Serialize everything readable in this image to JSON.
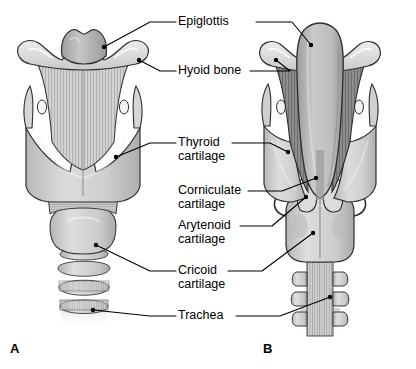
{
  "diagram": {
    "background": "#ffffff",
    "text_color": "#000000",
    "leader_color": "#000000"
  },
  "panels": [
    {
      "id": "A",
      "label": "A",
      "x": 10,
      "y": 341,
      "view": "anterior"
    },
    {
      "id": "B",
      "label": "B",
      "x": 263,
      "y": 341,
      "view": "posterior"
    }
  ],
  "labels": [
    {
      "name": "epiglottis",
      "line1": "Epiglottis",
      "line2": "",
      "x": 178,
      "y": 15
    },
    {
      "name": "hyoid-bone",
      "line1": "Hyoid bone",
      "line2": "",
      "x": 178,
      "y": 64
    },
    {
      "name": "thyroid",
      "line1": "Thyroid",
      "line2": "cartilage",
      "x": 178,
      "y": 136
    },
    {
      "name": "corniculate",
      "line1": "Corniculate",
      "line2": "cartilage",
      "x": 178,
      "y": 184
    },
    {
      "name": "arytenoid",
      "line1": "Arytenoid",
      "line2": "cartilage",
      "x": 178,
      "y": 219
    },
    {
      "name": "cricoid",
      "line1": "Cricoid",
      "line2": "cartilage",
      "x": 178,
      "y": 264
    },
    {
      "name": "trachea",
      "line1": "Trachea",
      "line2": "",
      "x": 178,
      "y": 309
    }
  ],
  "leaders": [
    {
      "name": "leader-epiglottis-a",
      "path": "M 176 22 L 150 22 L 104 47",
      "dot": [
        104,
        47
      ]
    },
    {
      "name": "leader-epiglottis-b",
      "path": "M 256 22 L 292 22 L 311 45",
      "dot": [
        311,
        45
      ]
    },
    {
      "name": "leader-hyoid-a",
      "path": "M 176 71 L 160 71 L 139 60",
      "dot": [
        139,
        60
      ]
    },
    {
      "name": "leader-hyoid-b",
      "path": "M 250 71 L 290 71 L 276 60",
      "dot": [
        276,
        60
      ]
    },
    {
      "name": "leader-thyroid-a",
      "path": "M 176 143 L 150 143 L 116 157",
      "dot": [
        116,
        157
      ]
    },
    {
      "name": "leader-thyroid-b",
      "path": "M 232 143 L 270 143 L 288 152",
      "dot": [
        288,
        152
      ]
    },
    {
      "name": "leader-corniculate",
      "path": "M 248 191 L 282 191 L 316 178",
      "dot": [
        316,
        178
      ]
    },
    {
      "name": "leader-arytenoid",
      "path": "M 240 226 L 272 226 L 306 197",
      "dot": [
        306,
        197
      ]
    },
    {
      "name": "leader-cricoid-a",
      "path": "M 176 271 L 150 271 L 96 245",
      "dot": [
        96,
        245
      ]
    },
    {
      "name": "leader-cricoid-b",
      "path": "M 228 271 L 262 271 L 313 233",
      "dot": [
        313,
        233
      ]
    },
    {
      "name": "leader-trachea-a",
      "path": "M 176 316 L 150 316 L 93 310",
      "dot": [
        93,
        310
      ]
    },
    {
      "name": "leader-trachea-b",
      "path": "M 236 316 L 280 316 L 330 297",
      "dot": [
        330,
        297
      ]
    }
  ],
  "palette": {
    "outline": "#2b2b2b",
    "cartilage_light": "#d8d8d8",
    "cartilage_mid": "#c2c2c2",
    "cartilage_dark": "#a8a8a8",
    "membrane_light": "#cfcfcf",
    "membrane_dark": "#8f8f8f",
    "epiglottis": "#b4b4b4",
    "highlight": "#f0f0f0"
  }
}
